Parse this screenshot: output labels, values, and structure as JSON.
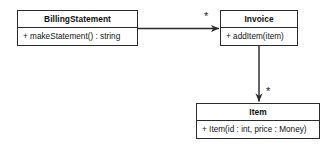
{
  "diagram": {
    "type": "uml-class-diagram",
    "background_color": "#ffffff",
    "line_color": "#2b2b2b",
    "text_color": "#111111",
    "classes": [
      {
        "id": "billingstatement",
        "name": "BillingStatement",
        "members": [
          "+ makeStatement() : string"
        ]
      },
      {
        "id": "invoice",
        "name": "Invoice",
        "members": [
          "+ addItem(item)"
        ]
      },
      {
        "id": "item",
        "name": "Item",
        "members": [
          "+ Item(id : int, price : Money)"
        ]
      }
    ],
    "associations": [
      {
        "id": "billingstatement-to-invoice",
        "source": "billingstatement",
        "target": "invoice",
        "direction": "horizontal-right",
        "arrow": "open-arrow",
        "target_multiplicity": "*"
      },
      {
        "id": "invoice-to-item",
        "source": "invoice",
        "target": "item",
        "direction": "vertical-down",
        "arrow": "open-arrow",
        "target_multiplicity": "*"
      }
    ]
  }
}
